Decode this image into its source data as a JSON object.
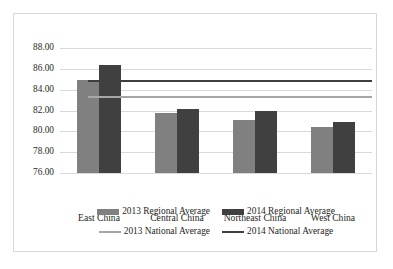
{
  "chart_data": {
    "type": "bar",
    "title": "",
    "xlabel": "",
    "ylabel": "",
    "categories": [
      "East China",
      "Central China",
      "Northeast China",
      "West China"
    ],
    "series": [
      {
        "name": "2013 Regional Average",
        "color": "#808080",
        "values": [
          84.9,
          81.8,
          81.1,
          80.45
        ]
      },
      {
        "name": "2014 Regional Average",
        "color": "#404040",
        "values": [
          86.4,
          82.1,
          82.0,
          80.9
        ]
      }
    ],
    "reference_lines": [
      {
        "name": "2013 National Average",
        "color": "#a6a6a6",
        "value": 83.3
      },
      {
        "name": "2014 National Average",
        "color": "#3f3f3f",
        "value": 84.85
      }
    ],
    "ylim": [
      76.0,
      88.0
    ],
    "ytick_step": 2.0,
    "ytick_labels": [
      "88.00",
      "86.00",
      "84.00",
      "82.00",
      "80.00",
      "78.00",
      "76.00"
    ],
    "ytick_values": [
      88.0,
      86.0,
      84.0,
      82.0,
      80.0,
      78.0,
      76.0
    ],
    "grid": true,
    "legend_position": "bottom"
  },
  "legend": {
    "row1": [
      {
        "label": "2013 Regional Average",
        "marker": "bar-swatch"
      },
      {
        "label": "2014 Regional Average",
        "marker": "bar-swatch"
      }
    ],
    "row2": [
      {
        "label": "2013 National Average",
        "marker": "line-swatch"
      },
      {
        "label": "2014 National Average",
        "marker": "line-swatch"
      }
    ]
  }
}
